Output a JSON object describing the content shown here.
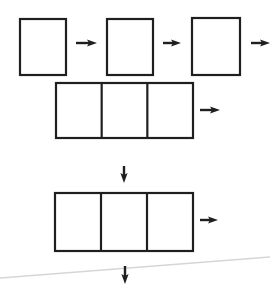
{
  "canvas": {
    "width": 270,
    "height": 286,
    "background": "#ffffff"
  },
  "colors": {
    "stroke": "#1f1f1f",
    "artifact_dark": "#3f3f3f",
    "artifact_fade": "#c2c2c2",
    "artifact_light": "#d6d6d6"
  },
  "stroke_width": 2.2,
  "boxes": [
    {
      "name": "process-box-1",
      "x": 20,
      "y": 19,
      "w": 46,
      "h": 56,
      "cells": 1
    },
    {
      "name": "process-box-2",
      "x": 107,
      "y": 19,
      "w": 46,
      "h": 56,
      "cells": 1
    },
    {
      "name": "process-box-3",
      "x": 192,
      "y": 18,
      "w": 48,
      "h": 57,
      "cells": 1
    },
    {
      "name": "combined-box-1",
      "x": 56,
      "y": 83,
      "w": 137,
      "h": 55,
      "cells": 3
    },
    {
      "name": "combined-box-2",
      "x": 55,
      "y": 193,
      "w": 138,
      "h": 58,
      "cells": 3
    }
  ],
  "arrows": [
    {
      "name": "arrow-right-icon-1",
      "dir": "right",
      "x": 76,
      "y": 43,
      "len": 21
    },
    {
      "name": "arrow-right-icon-2",
      "dir": "right",
      "x": 163,
      "y": 43,
      "len": 18
    },
    {
      "name": "arrow-right-icon-3",
      "dir": "right",
      "x": 251,
      "y": 43,
      "len": 19
    },
    {
      "name": "arrow-right-icon-4",
      "dir": "right",
      "x": 200,
      "y": 110,
      "len": 20
    },
    {
      "name": "arrow-right-icon-5",
      "dir": "right",
      "x": 200,
      "y": 220,
      "len": 18
    },
    {
      "name": "arrow-down-icon-1",
      "dir": "down",
      "x": 124,
      "y": 166,
      "len": 17
    },
    {
      "name": "arrow-down-icon-2",
      "dir": "down",
      "x": 125,
      "y": 266,
      "len": 18
    }
  ],
  "artifacts": [
    {
      "name": "scan-top-edge-line",
      "x1": 8,
      "y1": 4.5,
      "x2": 270,
      "y2": 4.5,
      "gradient": true,
      "width": 1.6
    },
    {
      "name": "scan-crease-line",
      "x1": 0,
      "y1": 278,
      "x2": 270,
      "y2": 257,
      "gradient": false,
      "width": 1.4
    }
  ]
}
